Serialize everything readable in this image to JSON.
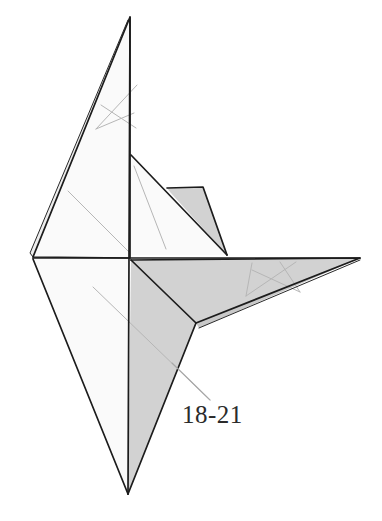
{
  "figure": {
    "kind": "origami-folding-diagram",
    "caption_label": "18-21",
    "background_color": "#ffffff",
    "palette": {
      "paper_front": "#fafafa",
      "paper_shaded": "#d2d2d2",
      "paper_shaded_light": "#dcdcdc",
      "paper_shaded_dark": "#c8c8c8",
      "outline": "#1c1c1c",
      "crease": "#b6b6b6",
      "leader": "#a8a8a8",
      "text": "#2b2b2b"
    },
    "canvas": {
      "width": 382,
      "height": 521
    },
    "key_points": {
      "top_apex": [
        130,
        17
      ],
      "left_vertex": [
        33,
        257
      ],
      "center_vertex": [
        130,
        258
      ],
      "bottom_apex": [
        128,
        494
      ],
      "right_wing_tip": [
        360,
        258
      ],
      "inner_flap_top": [
        131,
        155
      ],
      "inner_flap_point": [
        227,
        255
      ],
      "lower_fold_vertex": [
        196,
        323
      ]
    },
    "facets": [
      {
        "name": "upper-left-wing",
        "fill": "#fafafa",
        "points": "130,17 33,257 130,258"
      },
      {
        "name": "upper-left-wing-underlayer",
        "fill": "#ededed",
        "points": "130,17 30,253 33,257"
      },
      {
        "name": "inner-flap-white",
        "fill": "#fafafa",
        "points": "131,155 227,255 130,255"
      },
      {
        "name": "inner-flap-shaded",
        "fill": "#d2d2d2",
        "points": "167,188 203,187 227,255 170,192"
      },
      {
        "name": "lower-left-wing",
        "fill": "#fafafa",
        "points": "33,259 130,259 128,494"
      },
      {
        "name": "lower-center-shaded",
        "fill": "#d2d2d2",
        "points": "131,260 196,323 128,494"
      },
      {
        "name": "right-wing-shaded",
        "fill": "#d2d2d2",
        "points": "131,260 360,258 196,323"
      },
      {
        "name": "right-wing-underlayer",
        "fill": "#c9c9c9",
        "points": "196,323 360,258 199,328"
      }
    ],
    "creases": [
      {
        "name": "upper-wing-crease-a",
        "d": "M 96,129 L 137,85"
      },
      {
        "name": "upper-wing-crease-b",
        "d": "M 96,129 L 134,113"
      },
      {
        "name": "upper-wing-crease-c",
        "d": "M 101,105 L 136,128"
      },
      {
        "name": "upper-left-diagonal",
        "d": "M 68,191 L 129,252"
      },
      {
        "name": "inner-flap-crease",
        "d": "M 134,166 L 166,249"
      },
      {
        "name": "lower-left-long-diagonal",
        "d": "M 93,287 L 210,400"
      },
      {
        "name": "right-wing-crease-a",
        "d": "M 246,296 L 296,262"
      },
      {
        "name": "right-wing-crease-b",
        "d": "M 246,296 L 252,263"
      },
      {
        "name": "right-wing-crease-c",
        "d": "M 252,270 L 300,292"
      },
      {
        "name": "right-wing-crease-d",
        "d": "M 280,262 L 300,292"
      }
    ],
    "outlines": [
      {
        "name": "upper-left-wing-outline",
        "d": "M 130,17 L 33,257 L 130,258 Z"
      },
      {
        "name": "upper-left-wing-layer-edge",
        "d": "M 128,20 L 30,253 L 33,257"
      },
      {
        "name": "inner-flap-outline",
        "d": "M 131,155 L 227,255"
      },
      {
        "name": "inner-flap-shaded-outline",
        "d": "M 167,188 L 203,187 L 227,255"
      },
      {
        "name": "horizontal-spine",
        "d": "M 33,258 L 360,258"
      },
      {
        "name": "vertical-spine",
        "d": "M 130,17 L 128,494"
      },
      {
        "name": "lower-left-wing-outline",
        "d": "M 33,259 L 128,494"
      },
      {
        "name": "lower-center-fold",
        "d": "M 131,260 L 196,323 L 128,494"
      },
      {
        "name": "right-wing-outline",
        "d": "M 131,260 L 360,258 L 196,323"
      },
      {
        "name": "right-wing-layer-edge",
        "d": "M 199,328 L 360,260"
      }
    ],
    "leader_line": {
      "name": "caption-leader",
      "d": "M 210,400 L 172,363"
    },
    "caption_position": {
      "x": 182,
      "y": 423
    }
  }
}
